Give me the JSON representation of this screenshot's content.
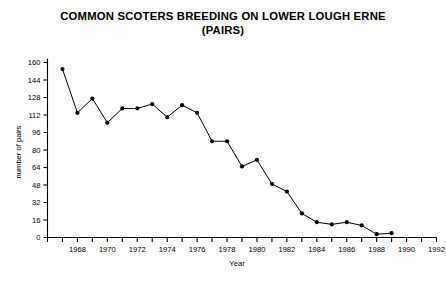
{
  "chart_data": {
    "type": "line",
    "title": "COMMON SCOTERS BREEDING ON LOWER LOUGH ERNE\n(PAIRS)",
    "title_line1": "COMMON SCOTERS BREEDING ON LOWER LOUGH ERNE",
    "title_line2": "(PAIRS)",
    "xlabel": "Year",
    "ylabel": "number of pairs",
    "xlim": [
      1966,
      1992
    ],
    "ylim": [
      0,
      160
    ],
    "ytick_step": 16,
    "xtick_step": 1,
    "xticklabel_step": 2,
    "grid": false,
    "legend": null,
    "marker": "filled-circle",
    "line_color": "#000000",
    "marker_color": "#000000",
    "yticks": [
      0,
      16,
      32,
      48,
      64,
      80,
      96,
      112,
      128,
      144,
      160
    ],
    "xticks": [
      1966,
      1967,
      1968,
      1969,
      1970,
      1971,
      1972,
      1973,
      1974,
      1975,
      1976,
      1977,
      1978,
      1979,
      1980,
      1981,
      1982,
      1983,
      1984,
      1985,
      1986,
      1987,
      1988,
      1989,
      1990,
      1991,
      1992
    ],
    "xticklabels": [
      1968,
      1970,
      1972,
      1974,
      1976,
      1978,
      1980,
      1982,
      1984,
      1986,
      1988,
      1990,
      1992
    ],
    "x": [
      1967,
      1968,
      1969,
      1970,
      1971,
      1972,
      1973,
      1974,
      1975,
      1976,
      1977,
      1978,
      1979,
      1980,
      1981,
      1982,
      1983,
      1984,
      1985,
      1986,
      1987,
      1988,
      1989,
      1990,
      1991,
      1992
    ],
    "values": [
      154,
      114,
      127,
      105,
      118,
      118,
      122,
      110,
      121,
      114,
      88,
      88,
      65,
      71,
      49,
      42,
      22,
      14,
      12,
      14,
      11,
      3,
      4,
      0,
      0,
      0
    ],
    "series": [
      {
        "name": "Common Scoter breeding pairs",
        "points": [
          {
            "year": 1967,
            "value": 154
          },
          {
            "year": 1968,
            "value": 114
          },
          {
            "year": 1969,
            "value": 127
          },
          {
            "year": 1970,
            "value": 105
          },
          {
            "year": 1971,
            "value": 118
          },
          {
            "year": 1972,
            "value": 118
          },
          {
            "year": 1973,
            "value": 122
          },
          {
            "year": 1974,
            "value": 110
          },
          {
            "year": 1975,
            "value": 121
          },
          {
            "year": 1976,
            "value": 114
          },
          {
            "year": 1977,
            "value": 88
          },
          {
            "year": 1978,
            "value": 88
          },
          {
            "year": 1979,
            "value": 65
          },
          {
            "year": 1980,
            "value": 71
          },
          {
            "year": 1981,
            "value": 49
          },
          {
            "year": 1982,
            "value": 42
          },
          {
            "year": 1983,
            "value": 22
          },
          {
            "year": 1984,
            "value": 14
          },
          {
            "year": 1985,
            "value": 12
          },
          {
            "year": 1986,
            "value": 14
          },
          {
            "year": 1987,
            "value": 11
          },
          {
            "year": 1988,
            "value": 3
          },
          {
            "year": 1989,
            "value": 4
          }
        ]
      }
    ]
  }
}
